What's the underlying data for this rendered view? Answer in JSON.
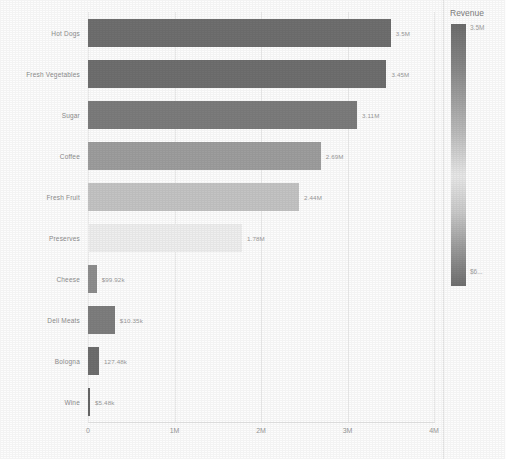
{
  "chart_data": {
    "type": "bar",
    "orientation": "horizontal",
    "title": "",
    "xlabel": "",
    "ylabel": "",
    "xlim": [
      0,
      4000000
    ],
    "grid": true,
    "legend_position": "right",
    "categories": [
      "Hot Dogs",
      "Fresh Vegetables",
      "Sugar",
      "Coffee",
      "Fresh Fruit",
      "Preserves",
      "Cheese",
      "Deli Meats",
      "Bologna",
      "Wine"
    ],
    "values": [
      3500000,
      3450000,
      3110000,
      2690000,
      2440000,
      1780000,
      99920,
      310350,
      127480,
      5480
    ],
    "value_labels": [
      "3.5M",
      "3.45M",
      "3.11M",
      "2.69M",
      "2.44M",
      "1.78M",
      "$99.92k",
      "$10.35k",
      "127.48k",
      "$5.48k"
    ],
    "bar_colors": [
      "#6f6f6f",
      "#6f6f6f",
      "#7c7c7c",
      "#9e9e9e",
      "#c4c4c4",
      "#efefef",
      "#8e8e8e",
      "#7e7e7e",
      "#6e6e6e",
      "#666666"
    ],
    "xticks": [
      0,
      1000000,
      2000000,
      3000000,
      4000000
    ],
    "xtick_labels": [
      "0",
      "1M",
      "2M",
      "3M",
      "4M"
    ]
  },
  "legend": {
    "title": "Revenue",
    "max_label": "3.5M",
    "min_label": "$6...",
    "gradient_top_color": "#6d6d6d",
    "gradient_mid_color": "#e8e8e8",
    "gradient_bottom_color": "#6f6f6f"
  }
}
